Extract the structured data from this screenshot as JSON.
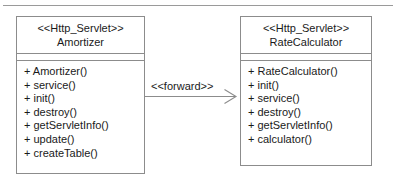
{
  "diagram": {
    "background_color": "#ffffff",
    "line_color": "#8c8c8c",
    "text_color": "#1a1a1a",
    "top_rule": "horizontal-rule"
  },
  "classes": [
    {
      "id": "amortizer",
      "stereotype": "<<Http_Servlet>>",
      "name": "Amortizer",
      "attributes": [],
      "operations": [
        "+ Amortizer()",
        "+ service()",
        "+ init()",
        "+ destroy()",
        "+ getServletInfo()",
        "+ update()",
        "+ createTable()"
      ]
    },
    {
      "id": "ratecalculator",
      "stereotype": "<<Http_Servlet>>",
      "name": "RateCalculator",
      "attributes": [],
      "operations": [
        "+ RateCalculator()",
        "+ init()",
        "+ service()",
        "+ destroy()",
        "+ getServletInfo()",
        "+ calculator()"
      ]
    }
  ],
  "connector": {
    "label": "<<forward>>",
    "kind": "open-arrow",
    "from": "Amortizer",
    "to": "RateCalculator"
  }
}
